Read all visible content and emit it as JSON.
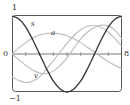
{
  "chart_data": {
    "type": "line",
    "title": "",
    "xlabel": "8",
    "ylabel": "",
    "y_tick_labels": [
      "1",
      "0",
      "−1"
    ],
    "yticks": [
      1,
      0,
      -1
    ],
    "ylim": [
      -1,
      1
    ],
    "xlim": [
      0,
      8
    ],
    "x_ticks": [
      0,
      1,
      2,
      3,
      4,
      5,
      6,
      7,
      8
    ],
    "grid": false,
    "legend": "inline labels",
    "x": [
      0,
      0.5,
      1,
      1.5,
      2,
      2.5,
      3,
      3.5,
      4,
      4.5,
      5,
      5.5,
      6,
      6.5,
      7,
      7.5,
      8
    ],
    "series": [
      {
        "name": "s",
        "color": "#333333",
        "values": [
          1.0,
          0.92,
          0.71,
          0.38,
          0.0,
          -0.38,
          -0.71,
          -0.92,
          -1.0,
          -0.92,
          -0.71,
          -0.38,
          0.0,
          0.38,
          0.71,
          0.92,
          1.0
        ]
      },
      {
        "name": "a",
        "color": "#bbbbbb",
        "values": [
          0.0,
          0.16,
          0.3,
          0.42,
          0.5,
          0.54,
          0.55,
          0.53,
          0.48,
          0.4,
          0.3,
          0.17,
          0.05,
          -0.08,
          -0.2,
          -0.3,
          -0.4
        ]
      },
      {
        "name": "v",
        "color": "#bbbbbb",
        "values": [
          -0.6,
          -0.7,
          -0.75,
          -0.72,
          -0.6,
          -0.4,
          -0.18,
          0.05,
          0.28,
          0.48,
          0.64,
          0.73,
          0.75,
          0.7,
          0.58,
          0.4,
          0.2
        ]
      },
      {
        "name": "",
        "color": "#bbbbbb",
        "values": [
          0.0,
          -0.15,
          -0.3,
          -0.42,
          -0.5,
          -0.52,
          -0.45,
          -0.3,
          -0.1,
          0.15,
          0.4,
          0.58,
          0.7,
          0.76,
          0.74,
          0.62,
          0.4
        ]
      }
    ],
    "curve_labels": [
      {
        "text": "s",
        "series": "s"
      },
      {
        "text": "a",
        "series": "a"
      },
      {
        "text": "v",
        "series": "v"
      }
    ]
  },
  "labels": {
    "y_top": "1",
    "y_zero": "0",
    "y_bottom": "−1",
    "x_end": "8",
    "curve_s": "s",
    "curve_a": "a",
    "curve_v": "v"
  }
}
